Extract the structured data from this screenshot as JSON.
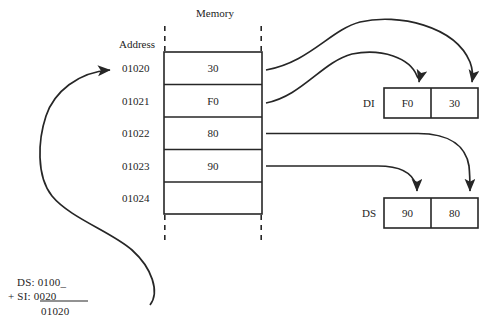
{
  "diagram": {
    "memory_title": "Memory",
    "address_title": "Address",
    "memory_rows": [
      {
        "address": "01020",
        "value": "30"
      },
      {
        "address": "01021",
        "value": "F0"
      },
      {
        "address": "01022",
        "value": "80"
      },
      {
        "address": "01023",
        "value": "90"
      },
      {
        "address": "01024",
        "value": ""
      }
    ],
    "registers": [
      {
        "name": "DI",
        "high": "F0",
        "low": "30"
      },
      {
        "name": "DS",
        "high": "90",
        "low": "80"
      }
    ],
    "calculation": {
      "line1": "DS: 0100_",
      "line2": "+  SI:   0020",
      "line2_prefix": "+  SI:",
      "line2_value": "0020",
      "result": "01020"
    },
    "faint_caption": "",
    "colors": {
      "stroke": "#262626",
      "text": "#242424",
      "background": "#ffffff"
    }
  }
}
